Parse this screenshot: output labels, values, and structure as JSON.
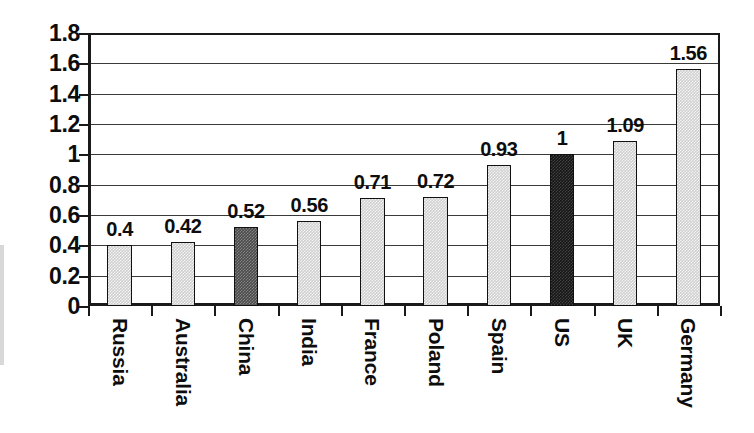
{
  "chart_data": {
    "type": "bar",
    "title": "",
    "subtitle": "",
    "xlabel": "",
    "ylabel": "",
    "categories": [
      "Russia",
      "Australia",
      "China",
      "India",
      "France",
      "Poland",
      "Spain",
      "US",
      "UK",
      "Germany"
    ],
    "values": [
      0.4,
      0.42,
      0.52,
      0.56,
      0.71,
      0.72,
      0.93,
      1,
      1.09,
      1.56
    ],
    "value_labels": [
      "0.4",
      "0.42",
      "0.52",
      "0.56",
      "0.71",
      "0.72",
      "0.93",
      "1",
      "1.09",
      "1.56"
    ],
    "ylim": [
      0,
      1.8
    ],
    "ytick_values": [
      0,
      0.2,
      0.4,
      0.6,
      0.8,
      1,
      1.2,
      1.4,
      1.6,
      1.8
    ],
    "ytick_labels": [
      "0",
      "0.2",
      "0.4",
      "0.6",
      "0.8",
      "1",
      "1.2",
      "1.4",
      "1.6",
      "1.8"
    ],
    "grid": true,
    "grid_axis": "y",
    "legend": false,
    "legend_position": "none",
    "bar_styles": [
      "light",
      "light",
      "mid",
      "light",
      "light",
      "light",
      "light",
      "dark",
      "light",
      "light"
    ],
    "series": [
      {
        "name": "",
        "values": [
          0.4,
          0.42,
          0.52,
          0.56,
          0.71,
          0.72,
          0.93,
          1,
          1.09,
          1.56
        ]
      }
    ]
  },
  "colors": {
    "bar_light": "#cfcfcf",
    "bar_mid": "#4a4a4a",
    "bar_dark": "#161616",
    "axis": "#1a1a1a",
    "gridline": "#3a3a3a",
    "text": "#0d0d0d",
    "background": "#ffffff"
  }
}
